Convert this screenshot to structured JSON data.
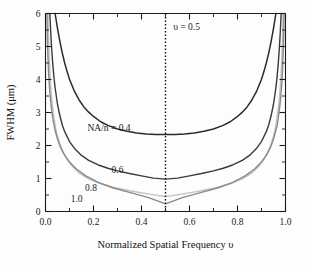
{
  "chart_data": {
    "type": "line",
    "title": "",
    "subtitle": "",
    "xlabel": "Normalized Spatial Frequency υ",
    "ylabel": "FWHM (μm)",
    "xlim": [
      0.0,
      1.0
    ],
    "ylim": [
      0,
      6
    ],
    "grid": false,
    "legend_position": "inline-curve-labels",
    "x_ticks": [
      "0.0",
      "0.2",
      "0.4",
      "0.6",
      "0.8",
      "1.0"
    ],
    "x_tick_values": [
      0.0,
      0.2,
      0.4,
      0.6,
      0.8,
      1.0
    ],
    "x_minor_tick_values": [
      0.1,
      0.3,
      0.5,
      0.7,
      0.9
    ],
    "y_ticks": [
      "0",
      "1",
      "2",
      "3",
      "4",
      "5",
      "6"
    ],
    "y_tick_values": [
      0,
      1,
      2,
      3,
      4,
      5,
      6
    ],
    "y_minor_tick_values": [
      0.5,
      1.5,
      2.5,
      3.5,
      4.5,
      5.5
    ],
    "annotations": [
      {
        "name": "v-half-annotation",
        "text": "υ = 0.5",
        "x": 0.52,
        "y": 5.5
      }
    ],
    "reference_lines": [
      {
        "name": "v-half-dotted-line",
        "orientation": "vertical",
        "x": 0.5,
        "style": "dotted",
        "color": "#111111"
      }
    ],
    "series": [
      {
        "name": "NA/n = 0.4",
        "label": "NA/n = 0.4",
        "color": "#2b2b2b",
        "width": 1.5,
        "min_value": 2.33,
        "label_x": 0.175,
        "label_y": 2.45,
        "x": [
          0.04,
          0.05,
          0.06,
          0.07,
          0.08,
          0.09,
          0.1,
          0.12,
          0.14,
          0.16,
          0.18,
          0.2,
          0.23,
          0.26,
          0.3,
          0.34,
          0.38,
          0.42,
          0.46,
          0.5,
          0.54,
          0.58,
          0.62,
          0.66,
          0.7,
          0.74,
          0.77,
          0.8,
          0.82,
          0.84,
          0.86,
          0.88,
          0.9,
          0.91,
          0.92,
          0.93,
          0.94,
          0.95,
          0.96
        ],
        "values": [
          6.0,
          5.55,
          5.15,
          4.8,
          4.5,
          4.24,
          4.01,
          3.65,
          3.38,
          3.17,
          3.01,
          2.88,
          2.72,
          2.61,
          2.5,
          2.43,
          2.38,
          2.35,
          2.33,
          2.33,
          2.33,
          2.35,
          2.38,
          2.43,
          2.5,
          2.61,
          2.72,
          2.88,
          3.01,
          3.17,
          3.38,
          3.65,
          4.01,
          4.24,
          4.5,
          4.8,
          5.15,
          5.55,
          6.0
        ]
      },
      {
        "name": "NA/n = 0.6",
        "label": "0.6",
        "color": "#3a3a3a",
        "width": 1.4,
        "min_value": 0.98,
        "label_x": 0.275,
        "label_y": 1.18,
        "x": [
          0.018,
          0.022,
          0.026,
          0.03,
          0.035,
          0.04,
          0.05,
          0.06,
          0.07,
          0.08,
          0.1,
          0.12,
          0.15,
          0.18,
          0.22,
          0.26,
          0.3,
          0.35,
          0.4,
          0.45,
          0.5,
          0.55,
          0.6,
          0.65,
          0.7,
          0.74,
          0.78,
          0.82,
          0.85,
          0.88,
          0.9,
          0.92,
          0.93,
          0.94,
          0.95,
          0.96,
          0.965,
          0.97,
          0.974,
          0.978,
          0.982
        ],
        "values": [
          6.0,
          5.4,
          4.9,
          4.5,
          4.08,
          3.75,
          3.25,
          2.9,
          2.62,
          2.42,
          2.12,
          1.92,
          1.7,
          1.55,
          1.41,
          1.31,
          1.23,
          1.15,
          1.08,
          1.01,
          0.98,
          1.01,
          1.08,
          1.15,
          1.23,
          1.31,
          1.41,
          1.55,
          1.7,
          1.92,
          2.12,
          2.42,
          2.62,
          2.9,
          3.25,
          3.75,
          4.08,
          4.5,
          4.9,
          5.4,
          6.0
        ]
      },
      {
        "name": "NA/n = 0.8",
        "label": "0.8",
        "color": "#c2c2c2",
        "width": 1.4,
        "min_value": 0.45,
        "label_x": 0.165,
        "label_y": 0.62,
        "x": [
          0.01,
          0.012,
          0.014,
          0.016,
          0.019,
          0.022,
          0.026,
          0.03,
          0.036,
          0.042,
          0.05,
          0.06,
          0.075,
          0.09,
          0.11,
          0.14,
          0.18,
          0.23,
          0.29,
          0.35,
          0.42,
          0.5,
          0.58,
          0.65,
          0.71,
          0.77,
          0.82,
          0.86,
          0.89,
          0.91,
          0.925,
          0.94,
          0.95,
          0.958,
          0.964,
          0.97,
          0.974,
          0.978,
          0.981,
          0.984,
          0.986,
          0.988,
          0.99
        ],
        "values": [
          6.0,
          5.4,
          4.95,
          4.55,
          4.1,
          3.75,
          3.4,
          3.12,
          2.8,
          2.54,
          2.28,
          2.04,
          1.78,
          1.58,
          1.38,
          1.17,
          0.99,
          0.84,
          0.72,
          0.63,
          0.54,
          0.45,
          0.54,
          0.63,
          0.72,
          0.84,
          0.99,
          1.17,
          1.38,
          1.58,
          1.78,
          2.04,
          2.28,
          2.54,
          2.8,
          3.12,
          3.4,
          3.75,
          4.1,
          4.55,
          4.95,
          5.4,
          6.0
        ]
      },
      {
        "name": "NA/n = 1.0",
        "label": "1.0",
        "color": "#8a8a8a",
        "width": 1.4,
        "min_value": 0.23,
        "label_x": 0.105,
        "label_y": 0.3,
        "x": [
          0.006,
          0.007,
          0.008,
          0.01,
          0.012,
          0.014,
          0.017,
          0.02,
          0.024,
          0.029,
          0.035,
          0.042,
          0.052,
          0.064,
          0.08,
          0.1,
          0.13,
          0.17,
          0.22,
          0.28,
          0.35,
          0.43,
          0.5,
          0.57,
          0.65,
          0.72,
          0.78,
          0.83,
          0.87,
          0.9,
          0.92,
          0.936,
          0.948,
          0.958,
          0.966,
          0.971,
          0.976,
          0.98,
          0.983,
          0.986,
          0.988,
          0.99,
          0.992,
          0.993,
          0.994
        ],
        "values": [
          6.0,
          5.55,
          5.2,
          4.72,
          4.35,
          4.05,
          3.72,
          3.46,
          3.18,
          2.9,
          2.64,
          2.4,
          2.15,
          1.92,
          1.7,
          1.5,
          1.28,
          1.07,
          0.88,
          0.72,
          0.58,
          0.42,
          0.23,
          0.42,
          0.58,
          0.72,
          0.88,
          1.07,
          1.28,
          1.5,
          1.7,
          1.92,
          2.15,
          2.4,
          2.64,
          2.9,
          3.18,
          3.46,
          3.72,
          4.05,
          4.35,
          4.72,
          5.2,
          5.55,
          6.0
        ]
      }
    ]
  }
}
